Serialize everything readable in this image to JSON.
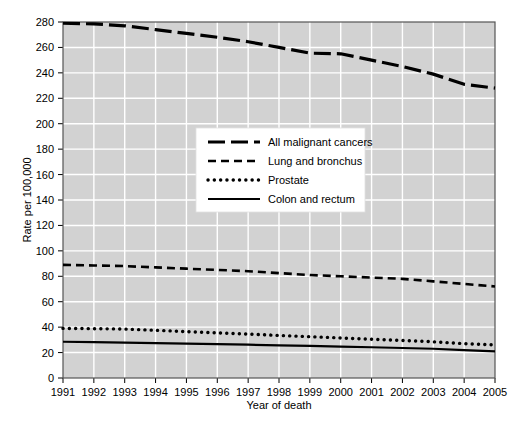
{
  "chart_data": {
    "type": "line",
    "title": "",
    "xlabel": "Year of death",
    "ylabel": "Rate per 100,000",
    "xlim": [
      1991,
      2005
    ],
    "ylim": [
      0,
      280
    ],
    "grid": true,
    "legend_position": "center",
    "plot_background": "#d2d2d2",
    "grid_color": "#ffffff",
    "line_color": "#000000",
    "x": [
      1991,
      1992,
      1993,
      1994,
      1995,
      1996,
      1997,
      1998,
      1999,
      2000,
      2001,
      2002,
      2003,
      2004,
      2005
    ],
    "xticklabels": [
      "1991",
      "1992",
      "1993",
      "1994",
      "1995",
      "1996",
      "1997",
      "1998",
      "1999",
      "2000",
      "2001",
      "2002",
      "2003",
      "2004",
      "2005"
    ],
    "yticks": [
      0,
      20,
      40,
      60,
      80,
      100,
      120,
      140,
      160,
      180,
      200,
      220,
      240,
      260,
      280
    ],
    "yticklabels": [
      "0",
      "20",
      "40",
      "60",
      "80",
      "100",
      "120",
      "140",
      "160",
      "180",
      "200",
      "220",
      "240",
      "260",
      "280"
    ],
    "series": [
      {
        "name": "All malignant cancers",
        "style": "long-dash",
        "values": [
          279,
          278.5,
          277,
          274,
          271,
          268,
          264.5,
          260,
          255.5,
          255,
          250,
          245,
          239,
          231,
          228
        ]
      },
      {
        "name": "Lung and bronchus",
        "style": "dash",
        "values": [
          89,
          88.5,
          88,
          87,
          86,
          85,
          84,
          82.5,
          81,
          80,
          79,
          78,
          76,
          74,
          72
        ]
      },
      {
        "name": "Prostate",
        "style": "dotted",
        "values": [
          39,
          38.8,
          38.5,
          37.5,
          36.5,
          35.5,
          34.5,
          33.5,
          32.5,
          31.5,
          30.5,
          29.5,
          28.5,
          27,
          26
        ]
      },
      {
        "name": "Colon and rectum",
        "style": "solid",
        "values": [
          28.5,
          28.2,
          27.8,
          27.4,
          27,
          26.6,
          26.2,
          25.7,
          25.2,
          24.7,
          24.2,
          23.6,
          23,
          22,
          21
        ]
      }
    ]
  },
  "legend": {
    "items": [
      {
        "label": "All malignant cancers",
        "style": "long-dash"
      },
      {
        "label": "Lung and bronchus",
        "style": "dash"
      },
      {
        "label": "Prostate",
        "style": "dotted"
      },
      {
        "label": "Colon and rectum",
        "style": "solid"
      }
    ]
  }
}
